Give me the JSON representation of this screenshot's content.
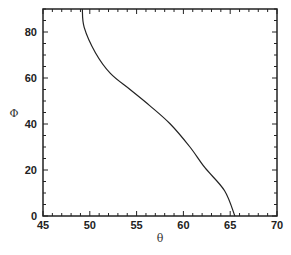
{
  "chart_data": {
    "type": "line",
    "title": "",
    "xlabel": "θ",
    "ylabel": "Φ",
    "xlim": [
      45,
      70
    ],
    "ylim": [
      0,
      90
    ],
    "xticks": [
      45,
      50,
      55,
      60,
      65,
      70
    ],
    "yticks": [
      0,
      20,
      40,
      60,
      80
    ],
    "grid": false,
    "legend": null,
    "series": [
      {
        "name": "curve",
        "color": "#222222",
        "x": [
          49.2,
          49.4,
          50.6,
          52.2,
          54.3,
          56.4,
          58.6,
          60.7,
          62.3,
          64.4,
          65.5
        ],
        "y": [
          90,
          82,
          71,
          62,
          55,
          48,
          40,
          30,
          21,
          11,
          0
        ]
      }
    ]
  }
}
